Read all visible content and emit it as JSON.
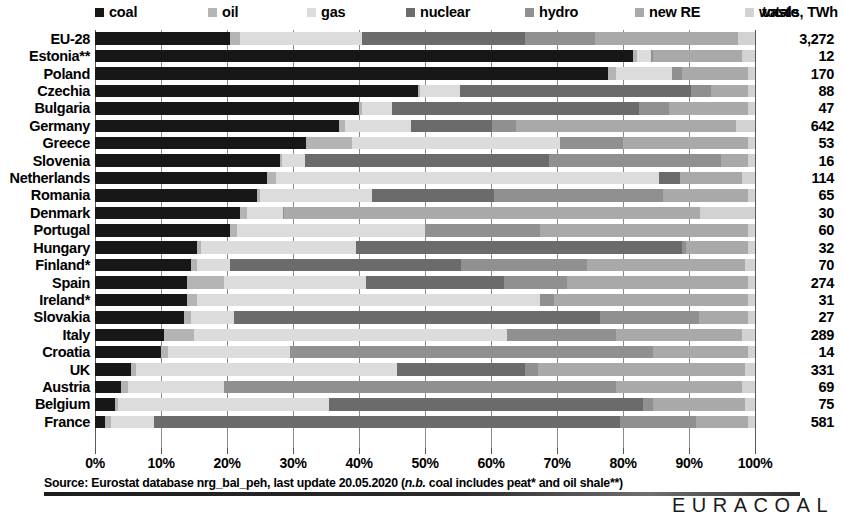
{
  "legend": {
    "items": [
      {
        "label": "coal",
        "color": "#171717",
        "x": 0
      },
      {
        "label": "oil",
        "color": "#b4b4b4",
        "x": 113
      },
      {
        "label": "gas",
        "color": "#dcdcdc",
        "x": 212
      },
      {
        "label": "nuclear",
        "color": "#6b6b6b",
        "x": 311
      },
      {
        "label": "hydro",
        "color": "#909090",
        "x": 430
      },
      {
        "label": "new RE",
        "color": "#a9a9a9",
        "x": 540
      },
      {
        "label": "waste",
        "color": "#d2d2d2",
        "x": 650
      }
    ]
  },
  "totals_header": "totals, TWh",
  "axis": {
    "ticks": [
      0,
      10,
      20,
      30,
      40,
      50,
      60,
      70,
      80,
      90,
      100
    ],
    "tick_labels": [
      "0%",
      "10%",
      "20%",
      "30%",
      "40%",
      "50%",
      "60%",
      "70%",
      "80%",
      "90%",
      "100%"
    ],
    "min": 0,
    "max": 100
  },
  "footer": {
    "source_prefix": "Source:  Eurostat database nrg_bal_peh, last update 20.05.2020 (",
    "source_italic": "n.b.",
    "source_suffix": " coal includes peat* and oil shale**)",
    "brand": "EURACOAL"
  },
  "chart_data": {
    "type": "bar",
    "orientation": "horizontal",
    "stacked": true,
    "normalized": true,
    "title": "",
    "xlabel": "",
    "ylabel": "",
    "xlim": [
      0,
      100
    ],
    "grid": true,
    "legend_position": "top",
    "unit": "% of total electricity generation",
    "series_names": [
      "coal",
      "oil",
      "gas",
      "nuclear",
      "hydro",
      "new RE",
      "waste"
    ],
    "series_colors": [
      "#171717",
      "#b4b4b4",
      "#dcdcdc",
      "#6b6b6b",
      "#909090",
      "#a9a9a9",
      "#d2d2d2"
    ],
    "categories": [
      "EU-28",
      "Estonia**",
      "Poland",
      "Czechia",
      "Bulgaria",
      "Germany",
      "Greece",
      "Slovenia",
      "Netherlands",
      "Romania",
      "Denmark",
      "Portugal",
      "Hungary",
      "Finland*",
      "Spain",
      "Ireland*",
      "Slovakia",
      "Italy",
      "Croatia",
      "UK",
      "Austria",
      "Belgium",
      "France"
    ],
    "totals_twh": [
      "3,272",
      "12",
      "170",
      "88",
      "47",
      "642",
      "53",
      "16",
      "114",
      "65",
      "30",
      "60",
      "32",
      "70",
      "274",
      "31",
      "27",
      "289",
      "14",
      "331",
      "69",
      "75",
      "581"
    ],
    "rows": [
      {
        "category": "EU-28",
        "total": "3,272",
        "values": [
          20.5,
          1.5,
          18.5,
          24.7,
          10.6,
          21.7,
          2.5
        ]
      },
      {
        "category": "Estonia**",
        "total": "12",
        "values": [
          81.5,
          0.6,
          2.2,
          0.0,
          0.2,
          13.5,
          2.0
        ]
      },
      {
        "category": "Poland",
        "total": "170",
        "values": [
          77.8,
          1.2,
          8.5,
          0.0,
          1.5,
          10.0,
          1.0
        ]
      },
      {
        "category": "Czechia",
        "total": "88",
        "values": [
          49.0,
          0.3,
          6.0,
          35.0,
          3.0,
          5.7,
          1.0
        ]
      },
      {
        "category": "Bulgaria",
        "total": "47",
        "values": [
          40.0,
          0.5,
          4.5,
          37.5,
          4.5,
          12.0,
          1.0
        ]
      },
      {
        "category": "Germany",
        "total": "642",
        "values": [
          37.0,
          0.9,
          10.0,
          12.2,
          3.7,
          33.4,
          2.8
        ]
      },
      {
        "category": "Greece",
        "total": "53",
        "values": [
          32.0,
          7.0,
          31.5,
          0.0,
          9.5,
          19.0,
          1.0
        ]
      },
      {
        "category": "Slovenia",
        "total": "16",
        "values": [
          28.0,
          0.3,
          3.5,
          37.0,
          26.0,
          4.2,
          1.0
        ]
      },
      {
        "category": "Netherlands",
        "total": "114",
        "values": [
          26.0,
          1.5,
          58.0,
          3.1,
          0.1,
          9.3,
          2.0
        ]
      },
      {
        "category": "Romania",
        "total": "65",
        "values": [
          24.5,
          0.5,
          17.0,
          18.5,
          25.5,
          13.0,
          1.0
        ]
      },
      {
        "category": "Denmark",
        "total": "30",
        "values": [
          22.0,
          1.0,
          5.5,
          0.0,
          0.1,
          63.0,
          8.4
        ]
      },
      {
        "category": "Portugal",
        "total": "60",
        "values": [
          20.5,
          1.0,
          28.5,
          0.0,
          17.5,
          31.5,
          1.0
        ]
      },
      {
        "category": "Hungary",
        "total": "32",
        "values": [
          15.5,
          0.5,
          23.5,
          49.5,
          0.6,
          9.4,
          1.0
        ]
      },
      {
        "category": "Finland*",
        "total": "70",
        "values": [
          14.5,
          1.0,
          5.0,
          35.0,
          19.0,
          24.0,
          1.5
        ]
      },
      {
        "category": "Spain",
        "total": "274",
        "values": [
          14.0,
          5.5,
          21.5,
          21.0,
          9.5,
          27.5,
          1.0
        ]
      },
      {
        "category": "Ireland*",
        "total": "31",
        "values": [
          14.0,
          1.5,
          52.0,
          0.0,
          2.0,
          29.5,
          1.0
        ]
      },
      {
        "category": "Slovakia",
        "total": "27",
        "values": [
          13.5,
          1.0,
          6.5,
          55.5,
          15.0,
          7.5,
          1.0
        ]
      },
      {
        "category": "Italy",
        "total": "289",
        "values": [
          10.5,
          4.5,
          47.5,
          0.0,
          16.5,
          19.0,
          2.0
        ]
      },
      {
        "category": "Croatia",
        "total": "14",
        "values": [
          10.0,
          1.0,
          18.5,
          0.0,
          55.0,
          14.5,
          1.0
        ]
      },
      {
        "category": "UK",
        "total": "331",
        "values": [
          5.5,
          0.7,
          39.5,
          19.5,
          2.0,
          31.3,
          1.5
        ]
      },
      {
        "category": "Austria",
        "total": "69",
        "values": [
          4.0,
          1.0,
          14.5,
          0.0,
          59.5,
          19.0,
          2.0
        ]
      },
      {
        "category": "Belgium",
        "total": "75",
        "values": [
          3.0,
          0.5,
          32.0,
          47.5,
          1.5,
          14.0,
          1.5
        ]
      },
      {
        "category": "France",
        "total": "581",
        "values": [
          1.5,
          1.0,
          6.5,
          70.5,
          11.5,
          8.0,
          1.0
        ]
      }
    ]
  }
}
